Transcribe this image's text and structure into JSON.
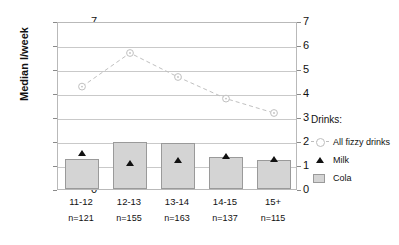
{
  "chart_data": {
    "type": "bar",
    "title": "",
    "xlabel": "",
    "ylabel": "Median l/week",
    "ylim": [
      0,
      7
    ],
    "y_ticks": [
      0,
      1,
      2,
      3,
      4,
      5,
      6,
      7
    ],
    "right_axis": true,
    "right_ylim": [
      0,
      7
    ],
    "right_y_ticks": [
      0,
      1,
      2,
      3,
      4,
      5,
      6,
      7
    ],
    "grid": true,
    "legend_position": "right",
    "legend_title": "Drinks:",
    "categories": [
      "11-12",
      "12-13",
      "13-14",
      "14-15",
      "15+"
    ],
    "sample_sizes": [
      "n=121",
      "n=155",
      "n=163",
      "n=137",
      "n=115"
    ],
    "series": [
      {
        "name": "All fizzy drinks",
        "type": "line",
        "marker": "circle-open",
        "linestyle": "dashed",
        "color": "#c0c0c0",
        "values": [
          4.35,
          5.75,
          4.75,
          3.85,
          3.25
        ]
      },
      {
        "name": "Milk",
        "type": "scatter",
        "marker": "triangle-filled",
        "color": "#111111",
        "values": [
          1.6,
          1.15,
          1.3,
          1.45,
          1.35
        ]
      },
      {
        "name": "Cola",
        "type": "bar",
        "color": "#d4d4d4",
        "values": [
          1.25,
          1.95,
          1.9,
          1.35,
          1.2
        ]
      }
    ]
  },
  "axis": {
    "y_label": "Median l/week",
    "left_ticks": [
      "7",
      "6",
      "5",
      "4",
      "3",
      "2",
      "1",
      "0"
    ],
    "right_ticks": [
      "7",
      "6",
      "5",
      "4",
      "3",
      "2",
      "1",
      "0"
    ]
  },
  "legend": {
    "title": "Drinks:",
    "entries": [
      {
        "label": "All fizzy drinks",
        "key": "line-circle-marker"
      },
      {
        "label": "Milk",
        "key": "triangle-marker"
      },
      {
        "label": "Cola",
        "key": "bar-swatch"
      }
    ]
  },
  "xaxis": {
    "categories": [
      {
        "label": "11-12",
        "n": "n=121"
      },
      {
        "label": "12-13",
        "n": "n=155"
      },
      {
        "label": "13-14",
        "n": "n=163"
      },
      {
        "label": "14-15",
        "n": "n=137"
      },
      {
        "label": "15+",
        "n": "n=115"
      }
    ]
  }
}
